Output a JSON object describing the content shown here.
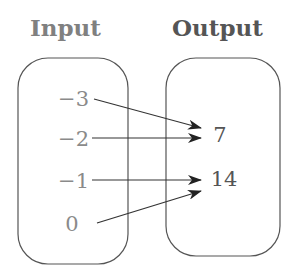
{
  "headers": {
    "input": "Input",
    "output": "Output"
  },
  "inputs": [
    "−3",
    "−2",
    "−1",
    "0"
  ],
  "outputs": [
    "7",
    "14"
  ],
  "mappings": [
    {
      "from": "−3",
      "to": "7"
    },
    {
      "from": "−2",
      "to": "7"
    },
    {
      "from": "−1",
      "to": "14"
    },
    {
      "from": "0",
      "to": "14"
    }
  ],
  "colors": {
    "input_text": "#8a8a8a",
    "output_text": "#555555",
    "box_stroke": "#555555",
    "arrow": "#333333"
  }
}
